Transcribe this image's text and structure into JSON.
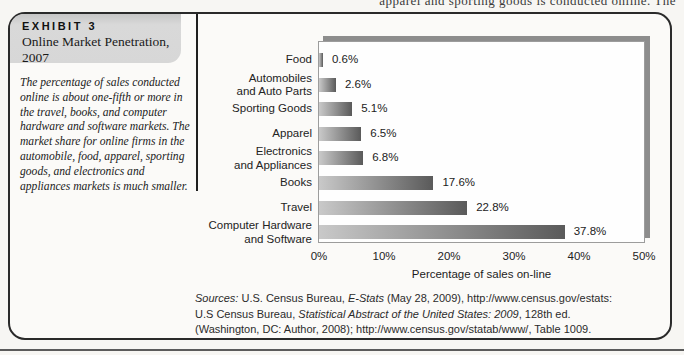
{
  "page": {
    "top_text_fragment": "apparel and sporting goods is conducted online. The"
  },
  "exhibit": {
    "label": "EXHIBIT 3",
    "title": "Online Market Penetration, 2007",
    "description": "The percentage of sales conducted online is about one-fifth or more in the travel, books, and computer hardware and software markets. The market share for online firms in the automobile, food, apparel, sporting goods, and electronics and appliances markets is much smaller."
  },
  "chart_data": {
    "type": "bar",
    "orientation": "horizontal",
    "categories": [
      "Food",
      "Automobiles and Auto Parts",
      "Sporting Goods",
      "Apparel",
      "Electronics and Appliances",
      "Books",
      "Travel",
      "Computer Hardware and Software"
    ],
    "category_lines": [
      [
        "Food"
      ],
      [
        "Automobiles",
        "and Auto Parts"
      ],
      [
        "Sporting Goods"
      ],
      [
        "Apparel"
      ],
      [
        "Electronics",
        "and Appliances"
      ],
      [
        "Books"
      ],
      [
        "Travel"
      ],
      [
        "Computer Hardware",
        "and Software"
      ]
    ],
    "values": [
      0.6,
      2.6,
      5.1,
      6.5,
      6.8,
      17.6,
      22.8,
      37.8
    ],
    "value_labels": [
      "0.6%",
      "2.6%",
      "5.1%",
      "6.5%",
      "6.8%",
      "17.6%",
      "22.8%",
      "37.8%"
    ],
    "xlim": [
      0,
      50
    ],
    "xticks": [
      "0%",
      "10%",
      "20%",
      "30%",
      "40%",
      "50%"
    ],
    "xtick_values": [
      0,
      10,
      20,
      30,
      40,
      50
    ],
    "xlabel": "Percentage of sales on-line",
    "grid": false,
    "legend": null,
    "bar_gradient": [
      "#c9c9c9",
      "#5a5a5a"
    ],
    "plot_background": "#fefefe",
    "shadow_color": "#8d8d8d"
  },
  "sources": {
    "lines": [
      [
        {
          "text": "Sources:",
          "italic": true
        },
        {
          "text": " U.S. Census Bureau, ",
          "italic": false
        },
        {
          "text": "E-Stats",
          "italic": true
        },
        {
          "text": " (May 28, 2009), http://www.census.gov/estats:",
          "italic": false
        }
      ],
      [
        {
          "text": "U.S Census Bureau, ",
          "italic": false
        },
        {
          "text": "Statistical Abstract of the United States: 2009",
          "italic": true
        },
        {
          "text": ", 128th ed.",
          "italic": false
        }
      ],
      [
        {
          "text": "(Washington, DC: Author, 2008); http://www.census.gov/statab/www/, Table 1009.",
          "italic": false
        }
      ]
    ]
  }
}
